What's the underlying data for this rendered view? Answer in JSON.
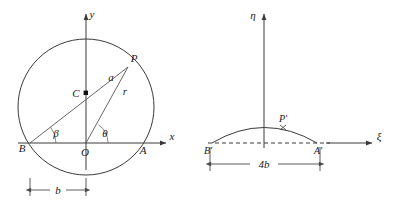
{
  "figure": {
    "background_color": "#ffffff",
    "line_color": "#3a3a3a",
    "label_color": "#1a1a1a"
  },
  "panels": [
    {
      "id": "left-panel",
      "name": "z-plane-circle-diagram",
      "axes": {
        "x_axis_label": "x",
        "y_axis_label": "y",
        "origin_label": "O"
      },
      "points": [
        {
          "key": "B",
          "label": "B",
          "x": 30,
          "y": 143
        },
        {
          "key": "O",
          "label": "O",
          "x": 86,
          "y": 143
        },
        {
          "key": "A",
          "label": "A",
          "x": 142,
          "y": 143
        },
        {
          "key": "C",
          "label": "C",
          "x": 86,
          "y": 93
        },
        {
          "key": "P",
          "label": "P",
          "x": 128,
          "y": 67
        }
      ],
      "segments": [
        {
          "key": "a",
          "label": "a",
          "from": "C",
          "to": "P"
        },
        {
          "key": "r",
          "label": "r",
          "from": "O",
          "to": "P"
        }
      ],
      "angles": [
        {
          "key": "beta",
          "label": "β",
          "vertex": "B"
        },
        {
          "key": "theta",
          "label": "θ",
          "vertex": "O"
        }
      ],
      "dimension": {
        "label": "b",
        "from": "B",
        "to": "O"
      },
      "circle": {
        "center_x": 86,
        "center_y": 107,
        "radius": 68
      }
    },
    {
      "id": "right-panel",
      "name": "zeta-plane-arc-diagram",
      "axes": {
        "x_axis_label": "ξ",
        "y_axis_label": "η"
      },
      "points": [
        {
          "key": "Bp",
          "label": "B'",
          "x": 212,
          "y": 143
        },
        {
          "key": "Ap",
          "label": "A'",
          "x": 317,
          "y": 143
        },
        {
          "key": "Pp",
          "label": "P'",
          "x": 283,
          "y": 129
        }
      ],
      "dimension": {
        "label": "4b",
        "from": "Bp",
        "to": "Ap"
      },
      "arc": {
        "start_x": 212,
        "end_x": 317,
        "baseline_y": 143,
        "peak_y": 126
      }
    }
  ]
}
